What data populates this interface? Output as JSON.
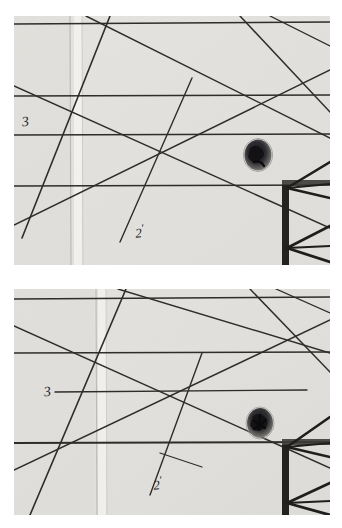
{
  "document": {
    "title": "Two stacked photographic plates of a hand-drawn line construction on paper",
    "medium": "grayscale photograph",
    "background_color": "#ffffff",
    "paper_color": "#e9e8e5",
    "ink_color": "#2a2a2a",
    "panel_count": 2
  },
  "panels": [
    {
      "id": "panel-top",
      "name": "upper-plate",
      "x": 14,
      "y": 16,
      "width": 316,
      "height": 249,
      "paper_color": "#e8e7e4",
      "annotations": [
        {
          "id": "label-3",
          "text": "3",
          "x": 22,
          "y": 122,
          "rotation": -8
        },
        {
          "id": "label-2-prime",
          "text": "2",
          "prime": "'",
          "x": 135,
          "y": 230,
          "rotation": -6
        }
      ],
      "marks": [
        {
          "id": "ink-blot",
          "type": "blot",
          "cx": 258,
          "cy": 155,
          "rx": 13,
          "ry": 15
        },
        {
          "id": "dark-post",
          "type": "vertical-post",
          "x": 285,
          "y": 184,
          "width": 7,
          "height": 82
        },
        {
          "id": "crease",
          "type": "vertical-crease",
          "x": 70,
          "y": 16,
          "height": 249
        }
      ],
      "lines": {
        "horizontal": [
          {
            "id": "h1",
            "x1": 14,
            "y1": 24,
            "x2": 330,
            "y2": 22
          },
          {
            "id": "h2",
            "x1": 14,
            "y1": 96,
            "x2": 330,
            "y2": 95
          },
          {
            "id": "h3",
            "x1": 14,
            "y1": 135,
            "x2": 330,
            "y2": 134
          },
          {
            "id": "h4",
            "x1": 14,
            "y1": 186,
            "x2": 330,
            "y2": 185
          }
        ],
        "diagonal": [
          {
            "id": "d1",
            "x1": 14,
            "y1": 86,
            "x2": 330,
            "y2": 228
          },
          {
            "id": "d2",
            "x1": 14,
            "y1": 225,
            "x2": 330,
            "y2": 70
          },
          {
            "id": "d3",
            "x1": 86,
            "y1": 16,
            "x2": 330,
            "y2": 138
          },
          {
            "id": "d4",
            "x1": 14,
            "y1": 235,
            "x2": 110,
            "y2": 16
          },
          {
            "id": "d5",
            "x1": 120,
            "y1": 240,
            "x2": 192,
            "y2": 78
          },
          {
            "id": "d6",
            "x1": 240,
            "y1": 16,
            "x2": 330,
            "y2": 112
          },
          {
            "id": "d7",
            "x1": 288,
            "y1": 190,
            "x2": 330,
            "y2": 160
          },
          {
            "id": "d8",
            "x1": 288,
            "y1": 190,
            "x2": 330,
            "y2": 200
          },
          {
            "id": "d9",
            "x1": 288,
            "y1": 248,
            "x2": 330,
            "y2": 228
          },
          {
            "id": "d10",
            "x1": 288,
            "y1": 248,
            "x2": 330,
            "y2": 262
          }
        ]
      }
    },
    {
      "id": "panel-bottom",
      "name": "lower-plate",
      "x": 14,
      "y": 289,
      "width": 316,
      "height": 226,
      "paper_color": "#e7e6e3",
      "annotations": [
        {
          "id": "label-3",
          "text": "3",
          "x": 44,
          "y": 396,
          "rotation": -8
        },
        {
          "id": "label-2-prime",
          "text": "2",
          "prime": "'",
          "x": 153,
          "y": 485,
          "rotation": -6
        }
      ],
      "marks": [
        {
          "id": "ink-blot",
          "type": "blot",
          "cx": 260,
          "cy": 423,
          "rx": 12,
          "ry": 14
        },
        {
          "id": "dark-post",
          "type": "vertical-post",
          "x": 285,
          "y": 444,
          "width": 7,
          "height": 71
        },
        {
          "id": "crease",
          "type": "vertical-crease",
          "x": 96,
          "y": 289,
          "height": 226
        }
      ],
      "lines": {
        "horizontal": [
          {
            "id": "h1",
            "x1": 14,
            "y1": 299,
            "x2": 330,
            "y2": 297
          },
          {
            "id": "h2",
            "x1": 14,
            "y1": 353,
            "x2": 330,
            "y2": 352
          },
          {
            "id": "h3",
            "x1": 55,
            "y1": 392,
            "x2": 307,
            "y2": 390
          },
          {
            "id": "h4",
            "x1": 14,
            "y1": 443,
            "x2": 330,
            "y2": 442
          }
        ],
        "diagonal": [
          {
            "id": "d1",
            "x1": 14,
            "y1": 326,
            "x2": 330,
            "y2": 468
          },
          {
            "id": "d2",
            "x1": 14,
            "y1": 470,
            "x2": 330,
            "y2": 320
          },
          {
            "id": "d3",
            "x1": 118,
            "y1": 289,
            "x2": 330,
            "y2": 353
          },
          {
            "id": "d4",
            "x1": 30,
            "y1": 515,
            "x2": 126,
            "y2": 289
          },
          {
            "id": "d5",
            "x1": 150,
            "y1": 495,
            "x2": 202,
            "y2": 353
          },
          {
            "id": "d6",
            "x1": 250,
            "y1": 289,
            "x2": 330,
            "y2": 372
          },
          {
            "id": "d7",
            "x1": 160,
            "y1": 453,
            "x2": 202,
            "y2": 467
          },
          {
            "id": "d8",
            "x1": 288,
            "y1": 443,
            "x2": 330,
            "y2": 415
          },
          {
            "id": "d9",
            "x1": 288,
            "y1": 443,
            "x2": 330,
            "y2": 455
          },
          {
            "id": "d10",
            "x1": 288,
            "y1": 505,
            "x2": 330,
            "y2": 486
          },
          {
            "id": "d11",
            "x1": 288,
            "y1": 505,
            "x2": 330,
            "y2": 515
          }
        ]
      }
    }
  ],
  "legend": {
    "label_3": "3",
    "label_2": "2",
    "prime_mark": "'"
  }
}
